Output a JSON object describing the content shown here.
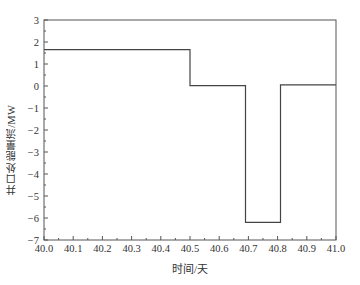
{
  "chart_data": {
    "type": "line",
    "step": true,
    "title": "",
    "xlabel": "时间/天",
    "ylabel": "井口处能量流/MW",
    "xlim": [
      40.0,
      41.0
    ],
    "ylim": [
      -7,
      3
    ],
    "xticks": [
      "40.0",
      "40.1",
      "40.2",
      "40.3",
      "40.4",
      "40.5",
      "40.6",
      "40.7",
      "40.8",
      "40.9",
      "41.0"
    ],
    "yticks": [
      "3",
      "2",
      "1",
      "0",
      "−1",
      "−2",
      "−3",
      "−4",
      "−5",
      "−6",
      "−7"
    ],
    "grid": false,
    "legend": null,
    "series": [
      {
        "name": "井口处能量流",
        "color": "#444444",
        "x": [
          40.0,
          40.5,
          40.5,
          40.69,
          40.69,
          40.81,
          40.81,
          41.0
        ],
        "y": [
          1.65,
          1.65,
          0.02,
          0.02,
          -6.2,
          -6.2,
          0.05,
          0.05
        ]
      }
    ]
  }
}
